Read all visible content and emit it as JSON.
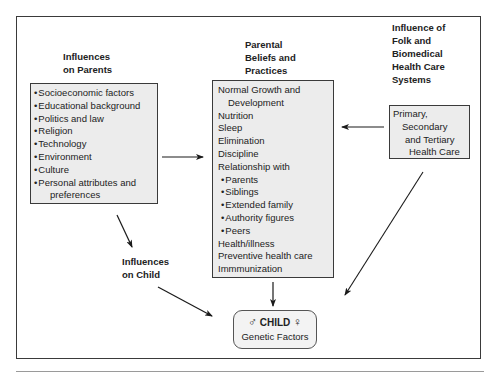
{
  "diagram": {
    "influences_on_parents": {
      "heading": [
        "Influences",
        "on Parents"
      ],
      "items": [
        "Socioeconomic factors",
        "Educational background",
        "Politics and law",
        "Religion",
        "Technology",
        "Environment",
        "Culture",
        "Personal attributes and",
        "preferences"
      ]
    },
    "parental_beliefs": {
      "heading": [
        "Parental",
        "Beliefs and",
        "Practices"
      ],
      "items": [
        "Normal Growth and",
        "Development",
        "Nutrition",
        "Sleep",
        "Elimination",
        "Discipline",
        "Relationship with",
        "Parents",
        "Siblings",
        "Extended family",
        "Authority figures",
        "Peers",
        "Health/illness",
        "Preventive health care",
        "Immmunization"
      ]
    },
    "health_care_systems": {
      "heading": [
        "Influence of",
        "Folk and",
        "Biomedical",
        "Health Care",
        "Systems"
      ],
      "items": [
        "Primary,",
        "Secondary",
        "and Tertiary",
        "Health Care"
      ]
    },
    "influences_on_child": {
      "heading": [
        "Influences",
        "on Child"
      ]
    },
    "child": {
      "male_symbol": "♂",
      "title": "CHILD",
      "female_symbol": "♀",
      "subtitle": "Genetic Factors"
    }
  },
  "colors": {
    "box_fill": "#ececec",
    "border": "#3a3a3a",
    "text": "#222222"
  }
}
